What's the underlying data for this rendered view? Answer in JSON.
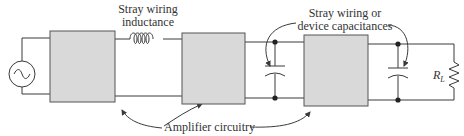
{
  "labels": {
    "inductance_line1": "Stray wiring",
    "inductance_line2": "inductance",
    "capacitance_line1": "Stray wiring or",
    "capacitance_line2": "device capacitances",
    "amplifier": "Amplifier circuitry",
    "load_resistor": "R",
    "load_resistor_sub": "L"
  },
  "colors": {
    "wire": "#3a3a3a",
    "amplifier_fill": "#d9d9d9",
    "amplifier_stroke": "#555555",
    "text": "#333333"
  },
  "components": [
    {
      "type": "ac-source",
      "label": ""
    },
    {
      "type": "amplifier-block",
      "index": 1
    },
    {
      "type": "inductor",
      "label": "Stray wiring inductance"
    },
    {
      "type": "amplifier-block",
      "index": 2
    },
    {
      "type": "capacitor",
      "label": "stray capacitance"
    },
    {
      "type": "amplifier-block",
      "index": 3
    },
    {
      "type": "capacitor",
      "label": "stray capacitance"
    },
    {
      "type": "resistor",
      "label": "RL"
    }
  ]
}
